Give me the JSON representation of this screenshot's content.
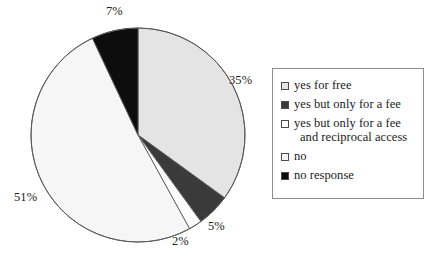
{
  "chart_data": {
    "type": "pie",
    "title": "",
    "subtitle": "",
    "xlabel": "",
    "ylabel": "",
    "grid": false,
    "legend_position": "right",
    "start_angle_deg": 0,
    "direction": "clockwise",
    "categories": [
      "yes for free",
      "yes but only for a fee",
      "yes but only for a fee and reciprocal access",
      "no",
      "no response"
    ],
    "values": [
      35,
      5,
      2,
      51,
      7
    ],
    "value_labels": [
      "35%",
      "5%",
      "2%",
      "51%",
      "7%"
    ],
    "units": "percent",
    "slice_colors": [
      "#e4e4e4",
      "#3a3a3a",
      "#ffffff",
      "#f6f6f6",
      "#0d0d0d"
    ],
    "slice_edge_color": "#5a5a5a",
    "slices": [
      {
        "label": "yes for free",
        "value": 35,
        "value_label": "35%",
        "color": "#e4e4e4"
      },
      {
        "label": "yes but only for a fee",
        "value": 5,
        "value_label": "5%",
        "color": "#3a3a3a"
      },
      {
        "label": "yes but only for a fee and reciprocal access",
        "value": 2,
        "value_label": "2%",
        "color": "#ffffff"
      },
      {
        "label": "no",
        "value": 51,
        "value_label": "51%",
        "color": "#f6f6f6"
      },
      {
        "label": "no response",
        "value": 7,
        "value_label": "7%",
        "color": "#0d0d0d"
      }
    ]
  },
  "legend": {
    "items": [
      {
        "label": "yes for free",
        "label_line2": "",
        "color": "#e4e4e4"
      },
      {
        "label": "yes but only for a fee",
        "label_line2": "",
        "color": "#3a3a3a"
      },
      {
        "label": "yes but only for a fee",
        "label_line2": "and reciprocal access",
        "color": "#ffffff"
      },
      {
        "label": "no",
        "label_line2": "",
        "color": "#f6f6f6"
      },
      {
        "label": "no response",
        "label_line2": "",
        "color": "#0d0d0d"
      }
    ]
  },
  "colors": {
    "background": "#ffffff",
    "text": "#1a1a1a",
    "legend_border": "#8c8c8c",
    "pie_outline": "#5a5a5a"
  }
}
